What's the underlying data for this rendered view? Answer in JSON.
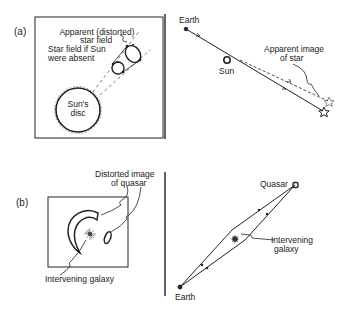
{
  "panel_a": {
    "label": "(a)",
    "left": {
      "apparent_field_label_1": "Apparent (distorted)",
      "apparent_field_label_2": "star field",
      "absent_field_label_1": "Star field if Sun",
      "absent_field_label_2": "were absent",
      "sun_disc_label_1": "Sun's",
      "sun_disc_label_2": "disc"
    },
    "right": {
      "earth_label": "Earth",
      "sun_label": "Sun",
      "apparent_image_label_1": "Apparent image",
      "apparent_image_label_2": "of star"
    }
  },
  "panel_b": {
    "label": "(b)",
    "left": {
      "distorted_image_label_1": "Distorted image",
      "distorted_image_label_2": "of quasar",
      "galaxy_label": "Intervening galaxy"
    },
    "right": {
      "quasar_label": "Quasar",
      "galaxy_label_1": "Intervening",
      "galaxy_label_2": "galaxy",
      "earth_label": "Earth"
    }
  },
  "colors": {
    "ink": "#222222",
    "background": "#ffffff"
  }
}
